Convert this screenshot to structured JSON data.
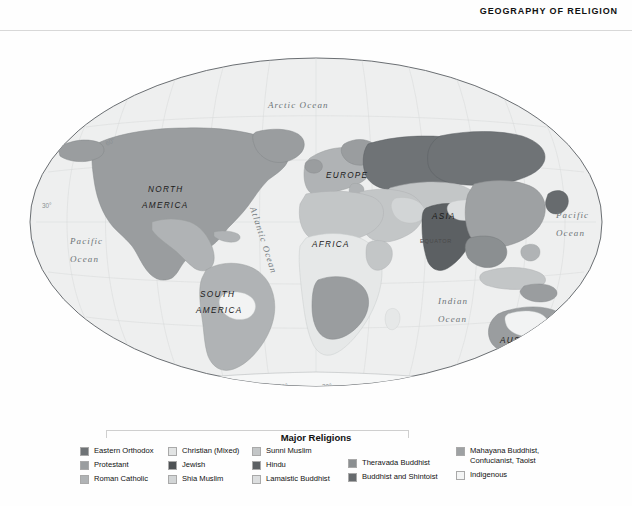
{
  "header": {
    "title": "GEOGRAPHY OF RELIGION"
  },
  "map": {
    "projection_outline": "oval",
    "oceans": [
      {
        "name": "arctic-ocean",
        "label": "Arctic  Ocean"
      },
      {
        "name": "pacific-ocean-west",
        "label_line1": "Pacific",
        "label_line2": "Ocean"
      },
      {
        "name": "pacific-ocean-east",
        "label_line1": "Pacific",
        "label_line2": "Ocean"
      },
      {
        "name": "atlantic-ocean",
        "label": "Atlantic Ocean"
      },
      {
        "name": "indian-ocean",
        "label_line1": "Indian",
        "label_line2": "Ocean"
      }
    ],
    "continents": [
      {
        "name": "north-america",
        "label_line1": "NORTH",
        "label_line2": "AMERICA"
      },
      {
        "name": "south-america",
        "label_line1": "SOUTH",
        "label_line2": "AMERICA"
      },
      {
        "name": "europe",
        "label": "EUROPE"
      },
      {
        "name": "africa",
        "label": "AFRICA"
      },
      {
        "name": "asia",
        "label": "ASIA"
      },
      {
        "name": "australia",
        "label": "AUSTRALIA"
      },
      {
        "name": "antarctica",
        "label": "ANTARCTICA"
      }
    ],
    "equator_label": "EQUATOR",
    "latitude_labels": [
      "60°",
      "30°",
      "0°",
      "30°"
    ],
    "longitude_labels": [
      "60°",
      "150°",
      "120°",
      "90°",
      "60°",
      "30°",
      "0°",
      "30°",
      "60°",
      "90°",
      "120°",
      "150°"
    ],
    "ocean_fill": "#eeefef",
    "outline_color": "#5a5f63"
  },
  "legend": {
    "title": "Major Religions",
    "columns": [
      {
        "items": [
          {
            "label": "Eastern Orthodox",
            "color": "#6f7376"
          },
          {
            "label": "Protestant",
            "color": "#9a9d9f"
          },
          {
            "label": "Roman Catholic",
            "color": "#b0b3b5"
          }
        ]
      },
      {
        "items": [
          {
            "label": "Christian (Mixed)",
            "color": "#e2e4e4"
          },
          {
            "label": "Jewish",
            "color": "#4d5154"
          },
          {
            "label": "Shia Muslim",
            "color": "#d2d5d6"
          }
        ]
      },
      {
        "items": [
          {
            "label": "Sunni Muslim",
            "color": "#c3c6c7"
          },
          {
            "label": "Hindu",
            "color": "#5c6063"
          },
          {
            "label": "Lamaistic Buddhist",
            "color": "#dcdedf"
          }
        ]
      },
      {
        "items": [
          {
            "label": "Theravada Buddhist",
            "color": "#8b8f91"
          },
          {
            "label": "Buddhist and Shintoist",
            "color": "#676b6e"
          }
        ]
      },
      {
        "items": [
          {
            "label": "Mahayana Buddhist,\nConfucianist, Taoist",
            "color": "#9ea1a3",
            "tall": true
          },
          {
            "label": "Indigenous",
            "color": "#f4f5f5"
          }
        ]
      }
    ]
  }
}
